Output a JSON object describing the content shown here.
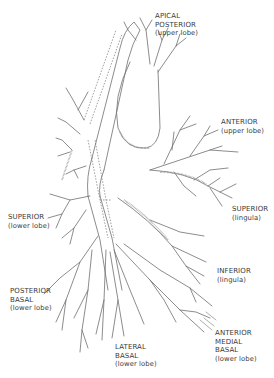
{
  "diagram": {
    "colors": {
      "background": "#ffffff",
      "line": "#6e6e6e",
      "text": "#3a3a3a"
    },
    "labels": [
      {
        "id": "apical-posterior",
        "lines": [
          "APICAL",
          "POSTERIOR"
        ],
        "sub": "(upper lobe)",
        "x": 155,
        "y": 12
      },
      {
        "id": "anterior-upper",
        "lines": [
          "ANTERIOR"
        ],
        "sub": "(upper lobe)",
        "x": 221,
        "y": 118
      },
      {
        "id": "superior-lingula",
        "lines": [
          "SUPERIOR"
        ],
        "sub": "(lingula)",
        "x": 232,
        "y": 205
      },
      {
        "id": "superior-lower",
        "lines": [
          "SUPERIOR"
        ],
        "sub": "(lower lobe)",
        "x": 8,
        "y": 213
      },
      {
        "id": "inferior-lingula",
        "lines": [
          "INFERIOR"
        ],
        "sub": "(lingula)",
        "x": 217,
        "y": 267
      },
      {
        "id": "posterior-basal",
        "lines": [
          "POSTERIOR",
          "BASAL"
        ],
        "sub": "(lower lobe)",
        "x": 10,
        "y": 287
      },
      {
        "id": "lateral-basal",
        "lines": [
          "LATERAL",
          "BASAL"
        ],
        "sub": "(lower lobe)",
        "x": 115,
        "y": 343
      },
      {
        "id": "anterior-medial-basal",
        "lines": [
          "ANTERIOR",
          "MEDIAL",
          "BASAL"
        ],
        "sub": "(lower lobe)",
        "x": 215,
        "y": 329
      }
    ]
  }
}
